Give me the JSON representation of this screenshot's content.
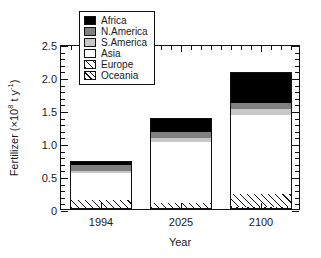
{
  "chart_data": {
    "type": "bar",
    "title": "",
    "subtitle": "",
    "stacked": true,
    "xlabel": "Year",
    "ylabel": "Fertilizer (×10⁸ t y⁻¹)",
    "ylabel_parts": {
      "prefix": "Fertilizer (×10",
      "exp1": "8",
      "mid": " t y",
      "exp2": "-1",
      "suffix": ")"
    },
    "categories": [
      "1994",
      "2025",
      "2100"
    ],
    "ylim": [
      0,
      2.5
    ],
    "yticks": [
      0,
      0.5,
      1.0,
      1.5,
      2.0,
      2.5
    ],
    "ytick_labels": [
      "0",
      "0.5",
      "1.0",
      "1.5",
      "2.0",
      "2.5"
    ],
    "yminor_step": 0.1,
    "grid": false,
    "legend_position": "top-center-inside",
    "series": [
      {
        "name": "Oceania",
        "fill": "diagonal-hatch-dense",
        "values": [
          0.02,
          0.01,
          0.03
        ]
      },
      {
        "name": "Europe",
        "fill": "diagonal-hatch",
        "values": [
          0.12,
          0.08,
          0.2
        ]
      },
      {
        "name": "Asia",
        "fill": "white",
        "values": [
          0.4,
          0.92,
          1.2
        ]
      },
      {
        "name": "S.America",
        "fill": "light-gray",
        "values": [
          0.03,
          0.07,
          0.08
        ]
      },
      {
        "name": "N.America",
        "fill": "dark-gray",
        "values": [
          0.1,
          0.09,
          0.09
        ]
      },
      {
        "name": "Africa",
        "fill": "black",
        "values": [
          0.05,
          0.21,
          0.47
        ]
      }
    ],
    "stack_order_bottom_to_top": [
      "Oceania",
      "Europe",
      "Asia",
      "S.America",
      "N.America",
      "Africa"
    ],
    "cumulative_tops": {
      "1994": [
        0.02,
        0.14,
        0.54,
        0.57,
        0.67,
        0.72
      ],
      "2025": [
        0.01,
        0.09,
        1.01,
        1.08,
        1.17,
        1.38
      ],
      "2100": [
        0.03,
        0.23,
        1.43,
        1.51,
        1.6,
        2.07
      ]
    },
    "totals": [
      0.72,
      1.38,
      2.07
    ]
  },
  "legend": {
    "items": [
      {
        "label": "Africa",
        "fill": "black",
        "color": "#000000"
      },
      {
        "label": "N.America",
        "fill": "dark-gray",
        "color": "#808080"
      },
      {
        "label": "S.America",
        "fill": "light-gray",
        "color": "#c8c8c8"
      },
      {
        "label": "Asia",
        "fill": "white",
        "color": "#ffffff"
      },
      {
        "label": "Europe",
        "fill": "diagonal-hatch",
        "color": "#ffffff"
      },
      {
        "label": "Oceania",
        "fill": "diagonal-hatch-dense",
        "color": "#ffffff"
      }
    ]
  },
  "colors": {
    "axis": "#111111",
    "background": "#ffffff",
    "text": "#1a1a1a"
  }
}
